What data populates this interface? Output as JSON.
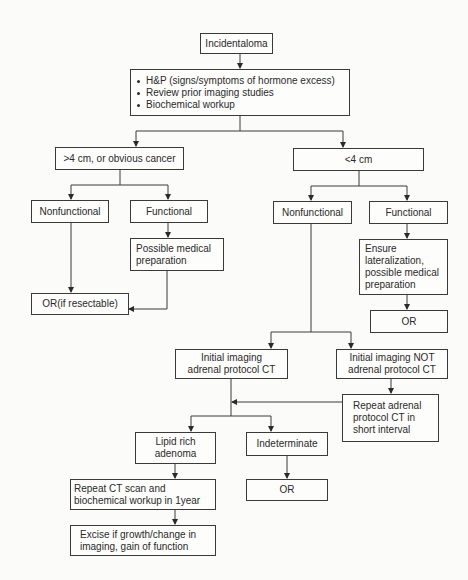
{
  "diagram": {
    "type": "flowchart",
    "nodes": {
      "root": {
        "label": "Incidentaloma"
      },
      "workup": {
        "items": [
          "H&P (signs/symptoms of hormone excess)",
          "Review prior imaging studies",
          "Biochemical workup"
        ]
      },
      "large": {
        "label": ">4 cm, or obvious cancer"
      },
      "small": {
        "label": "<4 cm"
      },
      "large_nonfunctional": {
        "label": "Nonfunctional"
      },
      "large_functional": {
        "label": "Functional"
      },
      "large_med_prep": {
        "label": "Possible medical\npreparation"
      },
      "or_resectable": {
        "label": "OR(if resectable)"
      },
      "small_nonfunctional": {
        "label": "Nonfunctional"
      },
      "small_functional": {
        "label": "Functional"
      },
      "ensure_lateralization": {
        "label": "Ensure\nlateralization,\npossible medical\npreparation"
      },
      "or_functional": {
        "label": "OR"
      },
      "initial_adrenal_ct": {
        "label": "Initial imaging\nadrenal protocol CT"
      },
      "initial_not_adrenal_ct": {
        "label": "Initial imaging NOT\nadrenal protocol CT"
      },
      "repeat_adrenal_ct": {
        "label": "Repeat adrenal\nprotocol CT in\nshort interval"
      },
      "lipid_rich": {
        "label": "Lipid rich\nadenoma"
      },
      "indeterminate": {
        "label": "Indeterminate"
      },
      "or_indeterminate": {
        "label": "OR"
      },
      "repeat_ct_1yr": {
        "label": "Repeat CT scan and\nbiochemical workup in 1year"
      },
      "excise": {
        "label": "Excise if growth/change in\nimaging, gain of function"
      }
    },
    "edges": [
      [
        "root",
        "workup"
      ],
      [
        "workup",
        "large"
      ],
      [
        "workup",
        "small"
      ],
      [
        "large",
        "large_nonfunctional"
      ],
      [
        "large",
        "large_functional"
      ],
      [
        "large_functional",
        "large_med_prep"
      ],
      [
        "large_nonfunctional",
        "or_resectable"
      ],
      [
        "large_med_prep",
        "or_resectable"
      ],
      [
        "small",
        "small_nonfunctional"
      ],
      [
        "small",
        "small_functional"
      ],
      [
        "small_functional",
        "ensure_lateralization"
      ],
      [
        "ensure_lateralization",
        "or_functional"
      ],
      [
        "small_nonfunctional",
        "initial_adrenal_ct"
      ],
      [
        "small_nonfunctional",
        "initial_not_adrenal_ct"
      ],
      [
        "initial_not_adrenal_ct",
        "repeat_adrenal_ct"
      ],
      [
        "repeat_adrenal_ct",
        "initial_adrenal_ct"
      ],
      [
        "initial_adrenal_ct",
        "lipid_rich"
      ],
      [
        "initial_adrenal_ct",
        "indeterminate"
      ],
      [
        "indeterminate",
        "or_indeterminate"
      ],
      [
        "lipid_rich",
        "repeat_ct_1yr"
      ],
      [
        "repeat_ct_1yr",
        "excise"
      ]
    ],
    "colors": {
      "line": "#3a3a3a",
      "background": "#fbfbfa",
      "text": "#2a2a2a"
    }
  }
}
